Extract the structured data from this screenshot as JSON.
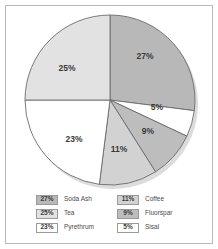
{
  "chart_data": {
    "type": "pie",
    "title": "",
    "categories": [
      "Soda Ash",
      "Tea",
      "Pyrethrum",
      "Coffee",
      "Fluorspar",
      "Sisal"
    ],
    "values": [
      27,
      25,
      23,
      11,
      9,
      5
    ],
    "value_labels": [
      "27%",
      "25%",
      "23%",
      "11%",
      "9%",
      "5%"
    ],
    "colors": [
      "#b8b8b8",
      "#e2e2e2",
      "#ffffff",
      "#d2d2d2",
      "#bdbdbd",
      "#ffffff"
    ],
    "legend_position": "bottom",
    "grid": false,
    "start_angle_deg": 0,
    "slices": [
      {
        "label": "Soda Ash",
        "value": 27,
        "value_label": "27%",
        "color": "#b8b8b8",
        "start_deg": 0,
        "end_deg": 97.2,
        "label_x": 145,
        "label_y": 59
      },
      {
        "label": "Sisal",
        "value": 5,
        "value_label": "5%",
        "color": "#ffffff",
        "start_deg": 97.2,
        "end_deg": 115.2,
        "label_x": 157,
        "label_y": 110
      },
      {
        "label": "Fluorspar",
        "value": 9,
        "value_label": "9%",
        "color": "#bdbdbd",
        "start_deg": 115.2,
        "end_deg": 147.6,
        "label_x": 148,
        "label_y": 134
      },
      {
        "label": "Coffee",
        "value": 11,
        "value_label": "11%",
        "color": "#d2d2d2",
        "start_deg": 147.6,
        "end_deg": 187.2,
        "label_x": 119,
        "label_y": 152
      },
      {
        "label": "Pyrethrum",
        "value": 23,
        "value_label": "23%",
        "color": "#ffffff",
        "start_deg": 187.2,
        "end_deg": 270,
        "label_x": 74,
        "label_y": 142
      },
      {
        "label": "Tea",
        "value": 25,
        "value_label": "25%",
        "color": "#e2e2e2",
        "start_deg": 270,
        "end_deg": 360,
        "label_x": 67,
        "label_y": 71
      }
    ]
  },
  "legend": {
    "columns": [
      {
        "items": [
          {
            "value_label": "27%",
            "label": "Soda Ash",
            "color": "#b8b8b8"
          },
          {
            "value_label": "25%",
            "label": "Tea",
            "color": "#e2e2e2"
          },
          {
            "value_label": "23%",
            "label": "Pyrethrum",
            "color": "#ffffff"
          }
        ]
      },
      {
        "items": [
          {
            "value_label": "11%",
            "label": "Coffee",
            "color": "#d2d2d2"
          },
          {
            "value_label": "9%",
            "label": "Fluorspar",
            "color": "#bdbdbd"
          },
          {
            "value_label": "5%",
            "label": "Sisal",
            "color": "#ffffff"
          }
        ]
      }
    ]
  },
  "style": {
    "frame_color": "#b9b9b9",
    "slice_outline": "#6b6b6b",
    "background": "#ffffff",
    "shadow_color": "#d8d8d8"
  }
}
